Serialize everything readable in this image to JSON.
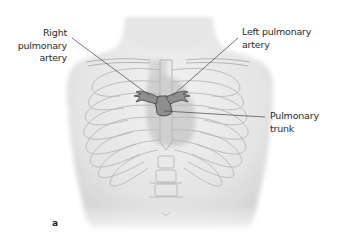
{
  "figure": {
    "panel_letter": "a",
    "labels": {
      "right_pulmonary_artery": {
        "line1": "Right",
        "line2": "pulmonary",
        "line3": "artery"
      },
      "left_pulmonary_artery": {
        "line1": "Left pulmonary",
        "line2": "artery"
      },
      "pulmonary_trunk": {
        "line1": "Pulmonary",
        "line2": "trunk"
      }
    },
    "colors": {
      "background": "#ffffff",
      "skin_shading": "#e9e9e9",
      "rib_outline": "#b8b8b8",
      "heart_shadow": "#c9c9c9",
      "artery_fill": "#8e8e8e",
      "artery_outline": "#444444",
      "leader_line": "#555555",
      "text": "#2b2b2b"
    }
  }
}
